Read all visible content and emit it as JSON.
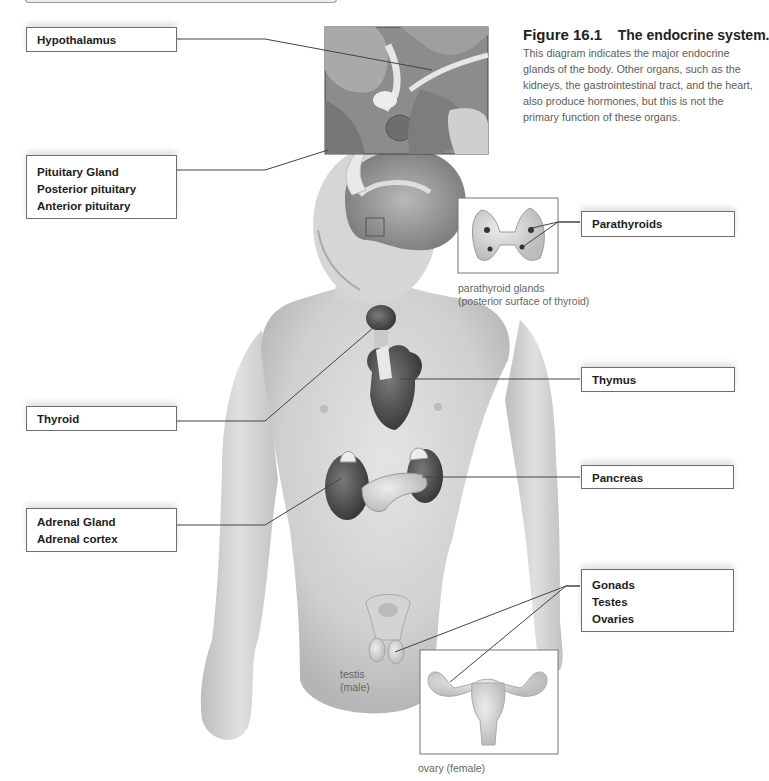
{
  "figure": {
    "number": "Figure 16.1",
    "title": "The endocrine system.",
    "caption": "This diagram indicates the major endocrine glands of the body. Other organs, such as the kidneys, the gastrointestinal tract, and the heart, also produce hormones, but this is not the primary function of these organs."
  },
  "labels": {
    "hypothalamus": [
      "Hypothalamus"
    ],
    "pituitary": [
      "Pituitary Gland",
      "Posterior pituitary",
      "Anterior pituitary"
    ],
    "thyroid": [
      "Thyroid"
    ],
    "adrenal": [
      "Adrenal Gland",
      "Adrenal cortex"
    ],
    "parathyroids": [
      "Parathyroids"
    ],
    "thymus": [
      "Thymus"
    ],
    "pancreas": [
      "Pancreas"
    ],
    "gonads": [
      "Gonads",
      "Testes",
      "Ovaries"
    ]
  },
  "insets": {
    "parathyroid_caption_1": "parathyroid glands",
    "parathyroid_caption_2": "(posterior surface of thyroid)",
    "testis_caption_1": "testis",
    "testis_caption_2": "(male)",
    "ovary_caption": "ovary (female)"
  },
  "colors": {
    "label_border": "#6e6e6e",
    "leader_line": "#444444",
    "caption_text": "#5d5d5d"
  }
}
